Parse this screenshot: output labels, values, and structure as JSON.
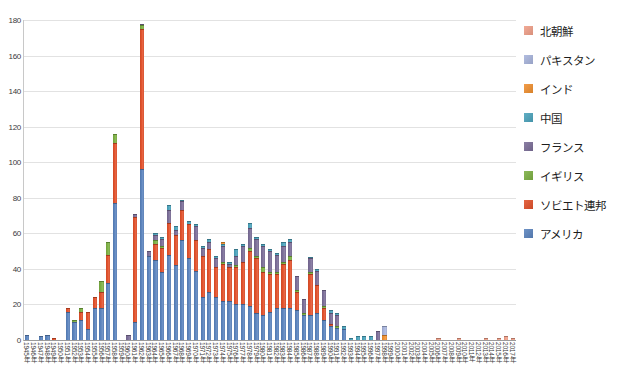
{
  "chart_data": {
    "type": "bar",
    "stacked": true,
    "title": "",
    "xlabel": "",
    "ylabel": "",
    "ylim": [
      0,
      180
    ],
    "y_ticks": [
      0,
      20,
      40,
      60,
      80,
      100,
      120,
      140,
      160,
      180
    ],
    "y_tick_labels": [
      "0",
      "20",
      "40",
      "60",
      "80",
      "100",
      "120",
      "140",
      "160",
      "180"
    ],
    "grid": true,
    "legend_position": "right",
    "colors": {
      "north_korea": "#f0a089",
      "pakistan": "#a8b4dc",
      "india": "#f09030",
      "china": "#4ba3bc",
      "france": "#7b6e98",
      "uk": "#7cb043",
      "soviet_union": "#e2512b",
      "usa": "#5b84be"
    },
    "categories": [
      "1945年",
      "1946年",
      "1947年",
      "1948年",
      "1949年",
      "1950年",
      "1951年",
      "1952年",
      "1953年",
      "1954年",
      "1955年",
      "1956年",
      "1957年",
      "1958年",
      "1959年",
      "1960年",
      "1961年",
      "1962年",
      "1963年",
      "1964年",
      "1965年",
      "1966年",
      "1967年",
      "1968年",
      "1969年",
      "1970年",
      "1971年",
      "1972年",
      "1973年",
      "1974年",
      "1975年",
      "1976年",
      "1977年",
      "1978年",
      "1979年",
      "1980年",
      "1981年",
      "1982年",
      "1983年",
      "1984年",
      "1985年",
      "1986年",
      "1987年",
      "1988年",
      "1989年",
      "1990年",
      "1991年",
      "1992年",
      "1993年",
      "1994年",
      "1995年",
      "1996年",
      "1997年",
      "1998年",
      "1999年",
      "2000年",
      "2001年",
      "2002年",
      "2003年",
      "2004年",
      "2005年",
      "2006年",
      "2007年",
      "2008年",
      "2009年",
      "2010年",
      "2011年",
      "2012年",
      "2013年",
      "2014年",
      "2015年",
      "2016年",
      "2017年"
    ],
    "series": [
      {
        "name": "アメリカ",
        "color": "#5b84be",
        "values": [
          3,
          0,
          2,
          3,
          0,
          0,
          16,
          10,
          11,
          6,
          18,
          18,
          32,
          77,
          0,
          0,
          10,
          96,
          47,
          45,
          38,
          48,
          42,
          56,
          46,
          39,
          24,
          27,
          24,
          22,
          22,
          20,
          20,
          19,
          15,
          14,
          16,
          18,
          18,
          18,
          17,
          14,
          14,
          15,
          11,
          8,
          7,
          6,
          0,
          0,
          0,
          0,
          0,
          0,
          0,
          0,
          0,
          0,
          0,
          0,
          0,
          0,
          0,
          0,
          0,
          0,
          0,
          0,
          0,
          0,
          0,
          0,
          0
        ]
      },
      {
        "name": "ソビエト連邦",
        "color": "#e2512b",
        "values": [
          0,
          0,
          0,
          0,
          1,
          0,
          2,
          0,
          5,
          10,
          6,
          9,
          16,
          34,
          0,
          0,
          59,
          79,
          0,
          9,
          14,
          18,
          17,
          17,
          19,
          17,
          23,
          24,
          17,
          21,
          19,
          21,
          24,
          31,
          31,
          24,
          21,
          19,
          25,
          27,
          10,
          0,
          23,
          16,
          7,
          1,
          0,
          0,
          0,
          0,
          0,
          0,
          0,
          0,
          0,
          0,
          0,
          0,
          0,
          0,
          0,
          0,
          0,
          0,
          0,
          0,
          0,
          0,
          0,
          0,
          0,
          0,
          0
        ]
      },
      {
        "name": "イギリス",
        "color": "#7cb043",
        "values": [
          0,
          0,
          0,
          0,
          0,
          0,
          0,
          1,
          2,
          0,
          0,
          6,
          7,
          5,
          0,
          0,
          0,
          2,
          0,
          2,
          1,
          0,
          0,
          0,
          0,
          0,
          0,
          0,
          0,
          1,
          0,
          1,
          0,
          2,
          1,
          3,
          1,
          1,
          1,
          2,
          1,
          1,
          1,
          0,
          1,
          0,
          1,
          0,
          0,
          0,
          0,
          0,
          0,
          0,
          0,
          0,
          0,
          0,
          0,
          0,
          0,
          0,
          0,
          0,
          0,
          0,
          0,
          0,
          0,
          0,
          0,
          0,
          0
        ]
      },
      {
        "name": "フランス",
        "color": "#7b6e98",
        "values": [
          0,
          0,
          0,
          0,
          0,
          0,
          0,
          0,
          0,
          0,
          0,
          0,
          0,
          0,
          0,
          3,
          2,
          1,
          3,
          3,
          4,
          7,
          3,
          5,
          0,
          8,
          5,
          4,
          5,
          9,
          2,
          5,
          9,
          11,
          10,
          12,
          12,
          10,
          9,
          8,
          8,
          8,
          8,
          8,
          9,
          6,
          6,
          0,
          0,
          0,
          0,
          0,
          5,
          0,
          0,
          0,
          0,
          0,
          0,
          0,
          0,
          0,
          0,
          0,
          0,
          0,
          0,
          0,
          0,
          0,
          0,
          0,
          0
        ]
      },
      {
        "name": "中国",
        "color": "#4ba3bc",
        "values": [
          0,
          0,
          0,
          0,
          0,
          0,
          0,
          0,
          0,
          0,
          0,
          0,
          0,
          0,
          0,
          0,
          0,
          0,
          0,
          1,
          1,
          3,
          2,
          1,
          2,
          1,
          1,
          2,
          1,
          1,
          1,
          4,
          1,
          3,
          1,
          1,
          1,
          1,
          2,
          2,
          0,
          0,
          1,
          1,
          0,
          2,
          1,
          2,
          1,
          2,
          2,
          2,
          0,
          0,
          0,
          0,
          0,
          0,
          0,
          0,
          0,
          0,
          0,
          0,
          0,
          0,
          0,
          0,
          0,
          0,
          0,
          0,
          0
        ]
      },
      {
        "name": "インド",
        "color": "#f09030",
        "values": [
          0,
          0,
          0,
          0,
          0,
          0,
          0,
          0,
          0,
          0,
          0,
          0,
          0,
          0,
          0,
          0,
          0,
          0,
          0,
          0,
          0,
          0,
          0,
          0,
          0,
          0,
          0,
          0,
          0,
          1,
          0,
          0,
          0,
          0,
          0,
          0,
          0,
          0,
          0,
          0,
          0,
          0,
          0,
          0,
          0,
          0,
          0,
          0,
          0,
          0,
          0,
          0,
          0,
          3,
          0,
          0,
          0,
          0,
          0,
          0,
          0,
          0,
          0,
          0,
          0,
          0,
          0,
          0,
          0,
          0,
          0,
          0,
          0
        ]
      },
      {
        "name": "パキスタン",
        "color": "#a8b4dc",
        "values": [
          0,
          0,
          0,
          0,
          0,
          0,
          0,
          0,
          0,
          0,
          0,
          0,
          0,
          0,
          0,
          0,
          0,
          0,
          0,
          0,
          0,
          0,
          0,
          0,
          0,
          0,
          0,
          0,
          0,
          0,
          0,
          0,
          0,
          0,
          0,
          0,
          0,
          0,
          0,
          0,
          0,
          0,
          0,
          0,
          0,
          0,
          0,
          0,
          0,
          0,
          0,
          0,
          0,
          5,
          0,
          0,
          0,
          0,
          0,
          0,
          0,
          0,
          0,
          0,
          0,
          0,
          0,
          0,
          0,
          0,
          0,
          0,
          0
        ]
      },
      {
        "name": "北朝鮮",
        "color": "#f0a089",
        "values": [
          0,
          0,
          0,
          0,
          0,
          0,
          0,
          0,
          0,
          0,
          0,
          0,
          0,
          0,
          0,
          0,
          0,
          0,
          0,
          0,
          0,
          0,
          0,
          0,
          0,
          0,
          0,
          0,
          0,
          0,
          0,
          0,
          0,
          0,
          0,
          0,
          0,
          0,
          0,
          0,
          0,
          0,
          0,
          0,
          0,
          0,
          0,
          0,
          0,
          0,
          0,
          0,
          0,
          0,
          0,
          0,
          0,
          0,
          0,
          0,
          0,
          1,
          0,
          0,
          1,
          0,
          0,
          0,
          1,
          0,
          1,
          2,
          1
        ]
      }
    ]
  },
  "legend": {
    "items": [
      {
        "label": "北朝鮮",
        "color": "#f0a089"
      },
      {
        "label": "パキスタン",
        "color": "#a8b4dc"
      },
      {
        "label": "インド",
        "color": "#f09030"
      },
      {
        "label": "中国",
        "color": "#4ba3bc"
      },
      {
        "label": "フランス",
        "color": "#7b6e98"
      },
      {
        "label": "イギリス",
        "color": "#7cb043"
      },
      {
        "label": "ソビエト連邦",
        "color": "#e2512b"
      },
      {
        "label": "アメリカ",
        "color": "#5b84be"
      }
    ]
  }
}
